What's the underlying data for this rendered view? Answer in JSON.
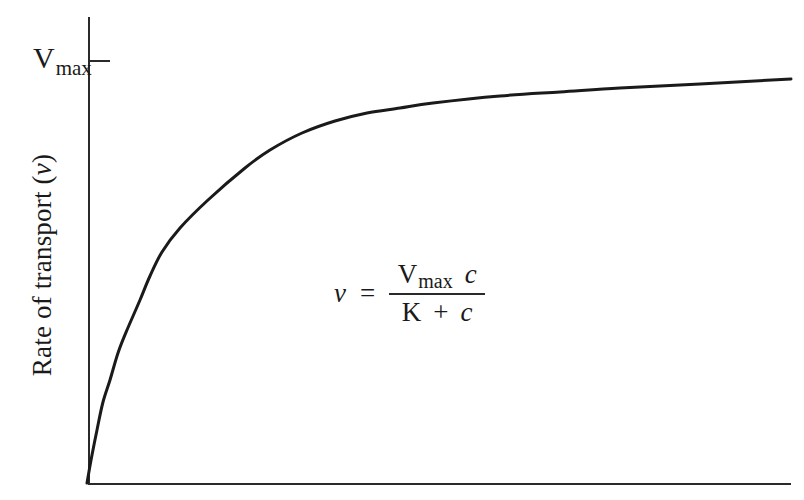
{
  "chart_data": {
    "type": "line",
    "title": "",
    "xlabel": "",
    "ylabel": "Rate of transport (ν)",
    "ylabel_parts": {
      "text": "Rate of transport (",
      "symbol": "ν",
      "close": ")"
    },
    "y_tick": {
      "label_main": "V",
      "label_sub": "max",
      "meaning": "asymptotic maximum rate"
    },
    "annotation": {
      "lhs": "ν",
      "equals": "=",
      "numerator_main": "V",
      "numerator_sub": "max",
      "numerator_var": "c",
      "denominator_const": "K",
      "denominator_op": "+",
      "denominator_var": "c"
    },
    "grid": false,
    "legend": null,
    "axes_px": {
      "origin": [
        87,
        483
      ],
      "x_end": [
        791,
        483
      ],
      "y_top": [
        89,
        17
      ],
      "vmax_tick_y": 61,
      "vmax_tick_x": [
        89,
        110
      ]
    },
    "series": [
      {
        "name": "ν = Vmax c / (K + c) (saturation curve)",
        "points_px": [
          [
            87,
            483
          ],
          [
            92,
            455
          ],
          [
            97,
            430
          ],
          [
            103,
            402
          ],
          [
            110,
            380
          ],
          [
            118,
            353
          ],
          [
            127,
            330
          ],
          [
            140,
            300
          ],
          [
            150,
            276
          ],
          [
            162,
            252
          ],
          [
            180,
            228
          ],
          [
            208,
            200
          ],
          [
            245,
            168
          ],
          [
            270,
            150
          ],
          [
            302,
            133
          ],
          [
            335,
            121
          ],
          [
            367,
            113
          ],
          [
            400,
            108
          ],
          [
            433,
            103
          ],
          [
            500,
            96
          ],
          [
            560,
            92
          ],
          [
            620,
            88
          ],
          [
            700,
            84
          ],
          [
            791,
            79
          ]
        ]
      }
    ],
    "model": {
      "form": "michaelis-menten",
      "K_relative": 0.096,
      "curve_end_fraction_of_vmax": 0.94
    }
  }
}
